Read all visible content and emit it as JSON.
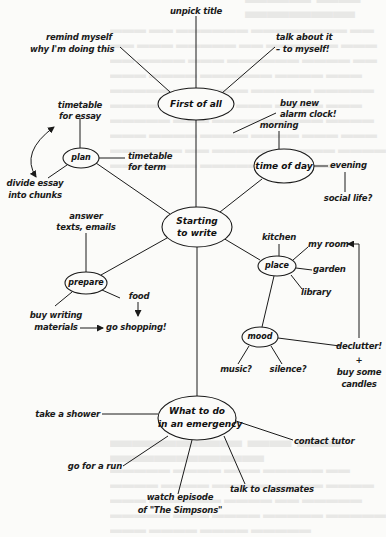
{
  "diagram": {
    "type": "mind-map",
    "central_node": {
      "id": "start",
      "label_line1": "Starting",
      "label_line2": "to write"
    },
    "nodes": {
      "first": {
        "label": "First of all"
      },
      "plan": {
        "label": "plan"
      },
      "time": {
        "label": "time of day"
      },
      "prepare": {
        "label": "prepare"
      },
      "place": {
        "label": "place"
      },
      "mood": {
        "label": "mood"
      },
      "emergency": {
        "label_line1": "What to do",
        "label_line2": "in an emergency"
      }
    },
    "leaves": {
      "unpick_title": "unpick title",
      "remind_1": "remind myself",
      "remind_2": "why I'm doing this",
      "talk_1": "talk about it",
      "talk_2": "– to myself!",
      "timetable_essay_1": "timetable",
      "timetable_essay_2": "for essay",
      "timetable_term_1": "timetable",
      "timetable_term_2": "for term",
      "divide_1": "divide essay",
      "divide_2": "into chunks",
      "buy_clock_1": "buy new",
      "buy_clock_2": "alarm clock!",
      "morning": "morning",
      "evening": "evening",
      "social": "social life?",
      "answer_1": "answer",
      "answer_2": "texts, emails",
      "food": "food",
      "buy_writing_1": "buy writing",
      "buy_writing_2": "materials",
      "go_shopping": "go shopping!",
      "kitchen": "kitchen",
      "my_room": "my room",
      "garden": "garden",
      "library": "library",
      "music": "music?",
      "silence": "silence?",
      "declutter": "declutter!",
      "plus": "+",
      "candles_1": "buy some",
      "candles_2": "candles",
      "shower": "take a shower",
      "run": "go for a run",
      "simpsons_1": "watch episode",
      "simpsons_2": "of \"The Simpsons\"",
      "classmates": "talk to classmates",
      "tutor": "contact tutor"
    },
    "edges": [
      [
        "start",
        "first"
      ],
      [
        "start",
        "plan"
      ],
      [
        "start",
        "time"
      ],
      [
        "start",
        "prepare"
      ],
      [
        "start",
        "place"
      ],
      [
        "start",
        "emergency"
      ],
      [
        "first",
        "unpick title"
      ],
      [
        "first",
        "remind myself why I'm doing this"
      ],
      [
        "first",
        "talk about it – to myself!"
      ],
      [
        "plan",
        "timetable for essay"
      ],
      [
        "plan",
        "timetable for term"
      ],
      [
        "plan",
        "divide essay into chunks"
      ],
      [
        "time",
        "morning"
      ],
      [
        "morning",
        "buy new alarm clock!"
      ],
      [
        "time",
        "evening"
      ],
      [
        "evening",
        "social life?"
      ],
      [
        "prepare",
        "answer texts, emails"
      ],
      [
        "prepare",
        "food"
      ],
      [
        "prepare",
        "buy writing materials"
      ],
      [
        "place",
        "kitchen"
      ],
      [
        "place",
        "my room"
      ],
      [
        "place",
        "garden"
      ],
      [
        "place",
        "library"
      ],
      [
        "place",
        "mood"
      ],
      [
        "mood",
        "music?"
      ],
      [
        "mood",
        "silence?"
      ],
      [
        "mood",
        "declutter! + buy some candles"
      ],
      [
        "emergency",
        "take a shower"
      ],
      [
        "emergency",
        "go for a run"
      ],
      [
        "emergency",
        "watch episode of \"The Simpsons\""
      ],
      [
        "emergency",
        "talk to classmates"
      ],
      [
        "emergency",
        "contact tutor"
      ]
    ],
    "arrows": [
      {
        "from": "timetable for essay",
        "to": "divide essay into chunks",
        "style": "curved-double"
      },
      {
        "from": "buy writing materials",
        "to": "go shopping!"
      },
      {
        "from": "food",
        "to": "go shopping!"
      },
      {
        "from": "declutter!",
        "to": "my room"
      }
    ],
    "ink_color": "#1a1a1a",
    "paper_color": "#fbfbf9"
  }
}
